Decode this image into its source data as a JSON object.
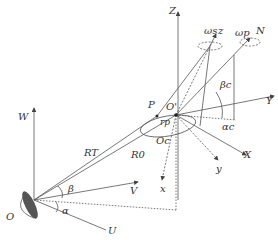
{
  "diagram": {
    "type": "coordinate-geometry",
    "labels": {
      "Z": "Z",
      "z": "z",
      "N": "N",
      "Y": "Y",
      "X": "X",
      "x": "x",
      "y": "y",
      "W": "W",
      "V": "V",
      "U": "U",
      "O": "O",
      "O_prime": "O'",
      "O_c": "Oc",
      "P": "P",
      "R_T": "RT",
      "R_0": "R0",
      "alpha": "α",
      "beta": "β",
      "alpha_c": "αc",
      "beta_c": "βc",
      "omega_s": "ωs",
      "omega_p": "ωp",
      "r_p": "rp"
    },
    "colors": {
      "line": "#555555",
      "dish": "#555555"
    }
  }
}
